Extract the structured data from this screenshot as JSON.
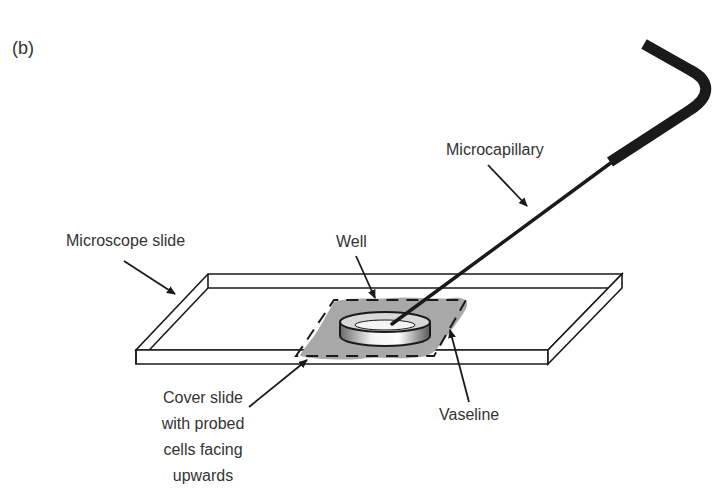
{
  "figure": {
    "panel_label": "(b)",
    "labels": {
      "microcapillary": "Microcapillary",
      "microscope_slide": "Microscope slide",
      "well": "Well",
      "vaseline": "Vaseline",
      "cover_slide_line1": "Cover slide",
      "cover_slide_line2": "with probed",
      "cover_slide_line3": "cells facing",
      "cover_slide_line4": "upwards"
    },
    "colors": {
      "line": "#1a1a1a",
      "vaseline": "#a8a8a8",
      "text": "#333333",
      "background": "#ffffff"
    }
  }
}
